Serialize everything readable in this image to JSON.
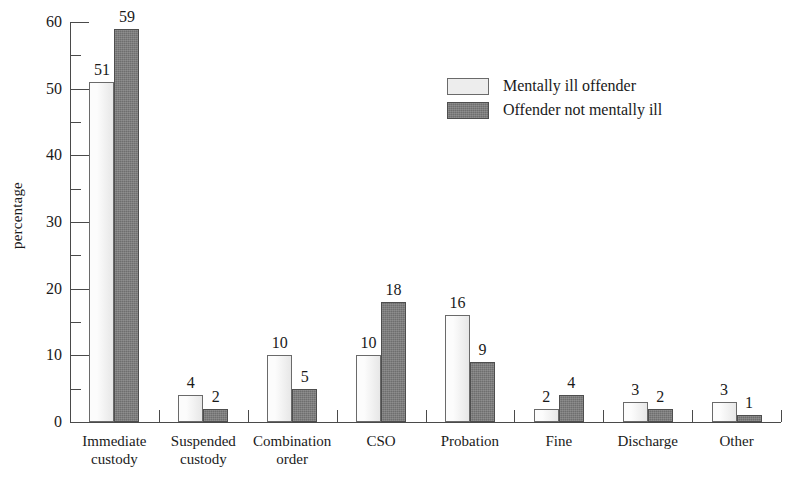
{
  "chart_data": {
    "type": "bar",
    "title": "",
    "xlabel": "",
    "ylabel": "percentage",
    "ylim": [
      0,
      60
    ],
    "ytick_step": 10,
    "yminor_step": 5,
    "grid": false,
    "legend_position": "upper-center-right",
    "ytick_labels": [
      "0",
      "10",
      "20",
      "30",
      "40",
      "50",
      "60"
    ],
    "categories": [
      "Immediate custody",
      "Suspended custody",
      "Combination order",
      "CSO",
      "Probation",
      "Fine",
      "Discharge",
      "Other"
    ],
    "category_lines": [
      [
        "Immediate",
        "custody"
      ],
      [
        "Suspended",
        "custody"
      ],
      [
        "Combination",
        "order"
      ],
      [
        "CSO"
      ],
      [
        "Probation"
      ],
      [
        "Fine"
      ],
      [
        "Discharge"
      ],
      [
        "Other"
      ]
    ],
    "series": [
      {
        "name": "Mentally ill offender",
        "color": "#ededed",
        "values": [
          51,
          4,
          10,
          10,
          16,
          2,
          3,
          3
        ]
      },
      {
        "name": "Offender not mentally ill",
        "color": "#6e6e6e",
        "values": [
          59,
          2,
          5,
          18,
          9,
          4,
          2,
          1
        ]
      }
    ]
  },
  "legend": {
    "items": [
      {
        "label": "Mentally ill offender",
        "swatch": "light"
      },
      {
        "label": "Offender not mentally ill",
        "swatch": "dark"
      }
    ]
  },
  "axes": {
    "y_title": "percentage"
  }
}
